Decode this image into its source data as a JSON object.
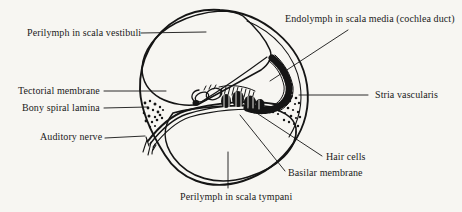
{
  "figure": {
    "ink_color": "#151515",
    "background_color": "#f7f6f2",
    "labels": {
      "perilymph_vestibuli": "Perilymph in scala vestibuli",
      "endolymph_scala_media": "Endolymph in scala media (cochlea duct)",
      "tectorial_membrane": "Tectorial membrane",
      "bony_spiral_lamina": "Bony spiral lamina",
      "auditory_nerve": "Auditory nerve",
      "stria_vascularis": "Stria vascularis",
      "hair_cells": "Hair cells",
      "basilar_membrane": "Basilar membrane",
      "perilymph_tympani": "Perilymph in scala tympani"
    }
  }
}
